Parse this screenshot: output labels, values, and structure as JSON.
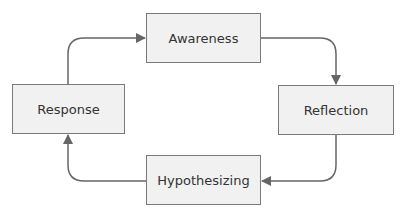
{
  "diagram": {
    "type": "cycle",
    "nodes": [
      {
        "id": "awareness",
        "label": "Awareness"
      },
      {
        "id": "reflection",
        "label": "Reflection"
      },
      {
        "id": "hypothesizing",
        "label": "Hypothesizing"
      },
      {
        "id": "response",
        "label": "Response"
      }
    ],
    "edges": [
      {
        "from": "awareness",
        "to": "reflection"
      },
      {
        "from": "reflection",
        "to": "hypothesizing"
      },
      {
        "from": "hypothesizing",
        "to": "response"
      },
      {
        "from": "response",
        "to": "awareness"
      }
    ],
    "colors": {
      "fill": "#f1f1f1",
      "border": "#7a7a7a",
      "arrow": "#666666",
      "text": "#333333"
    }
  }
}
